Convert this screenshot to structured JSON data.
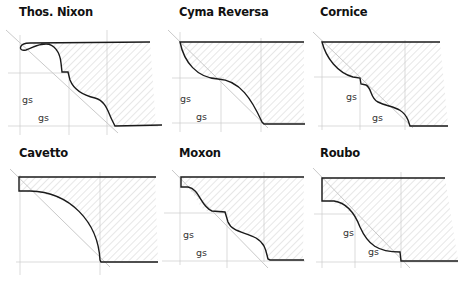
{
  "figure": {
    "colors": {
      "ink": "#1a1a1a",
      "guide": "#b8b8b8",
      "hatch": "#c9c9c9",
      "fill": "#f4f4f4"
    },
    "panels": [
      {
        "title": "Thos. Nixon",
        "labels": [
          "gs",
          "gs"
        ]
      },
      {
        "title": "Cyma Reversa",
        "labels": [
          "gs",
          "gs"
        ]
      },
      {
        "title": "Cornice",
        "labels": [
          "gs",
          "gs"
        ]
      },
      {
        "title": "Cavetto",
        "labels": []
      },
      {
        "title": "Moxon",
        "labels": [
          "gs",
          "gs"
        ]
      },
      {
        "title": "Roubo",
        "labels": [
          "gs",
          "gs"
        ]
      }
    ]
  }
}
